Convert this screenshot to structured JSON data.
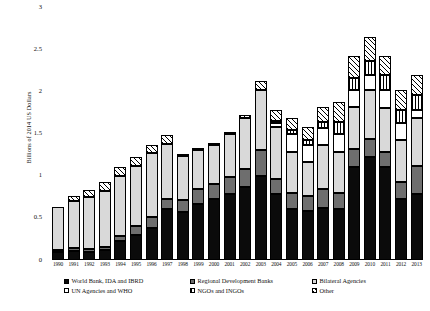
{
  "chart_data": {
    "type": "bar",
    "stacked": true,
    "title": "",
    "xlabel": "",
    "ylabel": "Billions of 2014 US Dollars",
    "ylim": [
      0,
      3
    ],
    "yticks": [
      "0",
      "0.5",
      "1",
      "1.5",
      "2",
      "2.5",
      "3"
    ],
    "grid": false,
    "legend_position": "bottom",
    "categories": [
      "1990",
      "1991",
      "1992",
      "1993",
      "1994",
      "1995",
      "1996",
      "1997",
      "1998",
      "1999",
      "2000",
      "2001",
      "2002",
      "2003",
      "2004",
      "2005",
      "2006",
      "2007",
      "2008",
      "2009",
      "2010",
      "2011",
      "2012",
      "2013"
    ],
    "series": [
      {
        "name": "World Bank, IDA and IBRD",
        "style": "solid-black",
        "color": "#0b0b0b",
        "values": [
          0.09,
          0.11,
          0.1,
          0.12,
          0.22,
          0.3,
          0.38,
          0.6,
          0.57,
          0.66,
          0.72,
          0.78,
          0.86,
          1.0,
          0.78,
          0.6,
          0.58,
          0.62,
          0.6,
          1.1,
          1.22,
          1.1,
          0.72,
          0.78
        ]
      },
      {
        "name": "Regional Development Banks",
        "style": "solid-dark-gray",
        "color": "#6e6e6e",
        "values": [
          0.02,
          0.03,
          0.03,
          0.04,
          0.06,
          0.1,
          0.13,
          0.12,
          0.14,
          0.18,
          0.18,
          0.2,
          0.22,
          0.3,
          0.18,
          0.2,
          0.18,
          0.22,
          0.2,
          0.22,
          0.22,
          0.18,
          0.2,
          0.34
        ]
      },
      {
        "name": "Bilateral Agencies",
        "style": "solid-light-gray",
        "color": "#d9d9d9",
        "values": [
          0.52,
          0.56,
          0.62,
          0.66,
          0.72,
          0.72,
          0.76,
          0.66,
          0.52,
          0.46,
          0.46,
          0.52,
          0.6,
          0.72,
          0.62,
          0.48,
          0.4,
          0.52,
          0.48,
          0.5,
          0.58,
          0.52,
          0.5,
          0.56
        ]
      },
      {
        "name": "UN Agencies and WHO",
        "style": "white",
        "color": "#ffffff",
        "values": [
          0.0,
          0.0,
          0.0,
          0.0,
          0.0,
          0.0,
          0.0,
          0.0,
          0.0,
          0.0,
          0.0,
          0.0,
          0.0,
          0.0,
          0.05,
          0.22,
          0.2,
          0.2,
          0.22,
          0.2,
          0.18,
          0.22,
          0.2,
          0.1
        ]
      },
      {
        "name": "NGOs and INGOs",
        "style": "vertical-lines",
        "color": "#ffffff",
        "values": [
          0.0,
          0.0,
          0.0,
          0.0,
          0.0,
          0.0,
          0.0,
          0.0,
          0.0,
          0.0,
          0.0,
          0.0,
          0.0,
          0.0,
          0.02,
          0.04,
          0.06,
          0.08,
          0.14,
          0.14,
          0.16,
          0.18,
          0.16,
          0.18
        ]
      },
      {
        "name": "Other",
        "style": "diagonal-hatch",
        "color": "#ffffff",
        "values": [
          0.0,
          0.06,
          0.08,
          0.1,
          0.1,
          0.1,
          0.1,
          0.1,
          0.02,
          0.02,
          0.02,
          0.02,
          0.04,
          0.1,
          0.12,
          0.14,
          0.16,
          0.18,
          0.24,
          0.26,
          0.28,
          0.22,
          0.24,
          0.24
        ]
      }
    ]
  },
  "legend": {
    "rows": [
      [
        {
          "label": "World Bank, IDA and IBRD",
          "style": "s0"
        },
        {
          "label": "Regional Development Banks",
          "style": "s1"
        },
        {
          "label": "Bilateral Agencies",
          "style": "s2"
        }
      ],
      [
        {
          "label": "UN Agencies and WHO",
          "style": "s3"
        },
        {
          "label": "NGOs and INGOs",
          "style": "s4"
        },
        {
          "label": "Other",
          "style": "s5"
        }
      ]
    ]
  }
}
